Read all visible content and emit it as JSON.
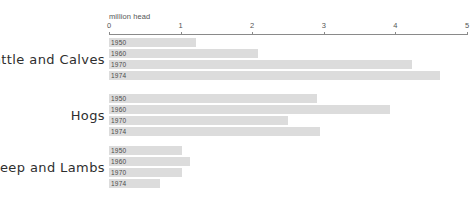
{
  "chart_data": {
    "type": "bar",
    "orientation": "horizontal",
    "title": "",
    "xlabel": "million head",
    "ylabel": "",
    "xlim": [
      0,
      5
    ],
    "xticks": [
      "0",
      "1",
      "2",
      "3",
      "4",
      "5"
    ],
    "grid": false,
    "legend": "none",
    "categories": [
      "Cattle and Calves",
      "Hogs",
      "Sheep and Lambs"
    ],
    "series": [
      {
        "name": "1950",
        "values": [
          1.22,
          2.9,
          1.02
        ]
      },
      {
        "name": "1960",
        "values": [
          2.08,
          3.92,
          1.13
        ]
      },
      {
        "name": "1970",
        "values": [
          4.23,
          2.5,
          1.02
        ]
      },
      {
        "name": "1974",
        "values": [
          4.62,
          2.95,
          0.71
        ]
      }
    ],
    "groups": [
      {
        "label": "Cattle and Calves",
        "bars": [
          {
            "year": "1950",
            "value": 1.22
          },
          {
            "year": "1960",
            "value": 2.08
          },
          {
            "year": "1970",
            "value": 4.23
          },
          {
            "year": "1974",
            "value": 4.62
          }
        ]
      },
      {
        "label": "Hogs",
        "bars": [
          {
            "year": "1950",
            "value": 2.9
          },
          {
            "year": "1960",
            "value": 3.92
          },
          {
            "year": "1970",
            "value": 2.5
          },
          {
            "year": "1974",
            "value": 2.95
          }
        ]
      },
      {
        "label": "Sheep and Lambs",
        "bars": [
          {
            "year": "1950",
            "value": 1.02
          },
          {
            "year": "1960",
            "value": 1.13
          },
          {
            "year": "1970",
            "value": 1.02
          },
          {
            "year": "1974",
            "value": 0.71
          }
        ]
      }
    ],
    "colors": {
      "bar": "#dcdcdc",
      "axis": "#8a8a8a",
      "background": "#ffffff",
      "group_label": "#2e2e2e",
      "tick_label": "#555555"
    }
  },
  "layout": {
    "axis_left_px": 109,
    "axis_right_px": 467,
    "group_tops_px": [
      38,
      94,
      146
    ],
    "bar_height_px": 9,
    "bar_gap_px": 2
  }
}
